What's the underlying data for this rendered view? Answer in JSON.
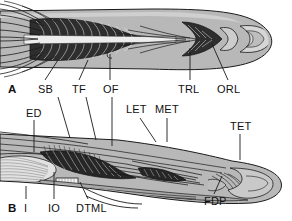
{
  "figure": {
    "type": "anatomical-illustration",
    "panel_count": 2,
    "ink_color": "#1a1a1a",
    "tissue_fill": "#b9b9b9",
    "muscle_fill": "#2b2b2b",
    "bone_fill": "#d8d8d8",
    "background": "#ffffff"
  },
  "panels": [
    {
      "id": "A",
      "view": "dorsal",
      "labels": [
        {
          "key": "SB",
          "text": "SB",
          "x": 38,
          "y": 84,
          "lead": [
            [
              45,
              96
            ],
            [
              58,
              60
            ]
          ]
        },
        {
          "key": "TF",
          "text": "TF",
          "x": 72,
          "y": 84,
          "lead": [
            [
              78,
              96
            ],
            [
              88,
              60
            ]
          ]
        },
        {
          "key": "OF",
          "text": "OF",
          "x": 104,
          "y": 84,
          "lead": [
            [
              110,
              96
            ],
            [
              110,
              58
            ]
          ]
        },
        {
          "key": "TRL",
          "text": "TRL",
          "x": 180,
          "y": 84,
          "lead": [
            [
              190,
              96
            ],
            [
              190,
              48
            ]
          ]
        },
        {
          "key": "ORL",
          "text": "ORL",
          "x": 219,
          "y": 84,
          "lead": [
            [
              228,
              96
            ],
            [
              212,
              44
            ]
          ]
        }
      ]
    },
    {
      "id": "B",
      "view": "lateral",
      "labels": [
        {
          "key": "ED",
          "text": "ED",
          "x": 27,
          "y": 114,
          "lead": [
            [
              34,
              126
            ],
            [
              34,
              152
            ]
          ]
        },
        {
          "key": "LET",
          "text": "LET",
          "x": 127,
          "y": 110,
          "lead": [
            [
              140,
              122
            ],
            [
              155,
              140
            ]
          ]
        },
        {
          "key": "MET",
          "text": "MET",
          "x": 156,
          "y": 110,
          "lead": [
            [
              167,
              122
            ],
            [
              167,
              140
            ]
          ]
        },
        {
          "key": "TET",
          "text": "TET",
          "x": 231,
          "y": 127,
          "lead": [
            [
              240,
              139
            ],
            [
              240,
              158
            ]
          ]
        },
        {
          "key": "FDP",
          "text": "FDP",
          "x": 205,
          "y": 200,
          "lead": [
            [
              214,
              198
            ],
            [
              222,
              176
            ]
          ]
        },
        {
          "key": "I",
          "text": "I",
          "x": 24,
          "y": 204,
          "lead": [
            [
              26,
              202
            ],
            [
              26,
              186
            ]
          ]
        },
        {
          "key": "IO",
          "text": "IO",
          "x": 48,
          "y": 204,
          "lead": [
            [
              54,
              202
            ],
            [
              54,
              172
            ]
          ]
        },
        {
          "key": "DTML",
          "text": "DTML",
          "x": 78,
          "y": 204,
          "lead": [
            [
              86,
              202
            ],
            [
              78,
              182
            ]
          ]
        }
      ]
    }
  ],
  "panel_ids": {
    "a": "A",
    "b": "B"
  }
}
